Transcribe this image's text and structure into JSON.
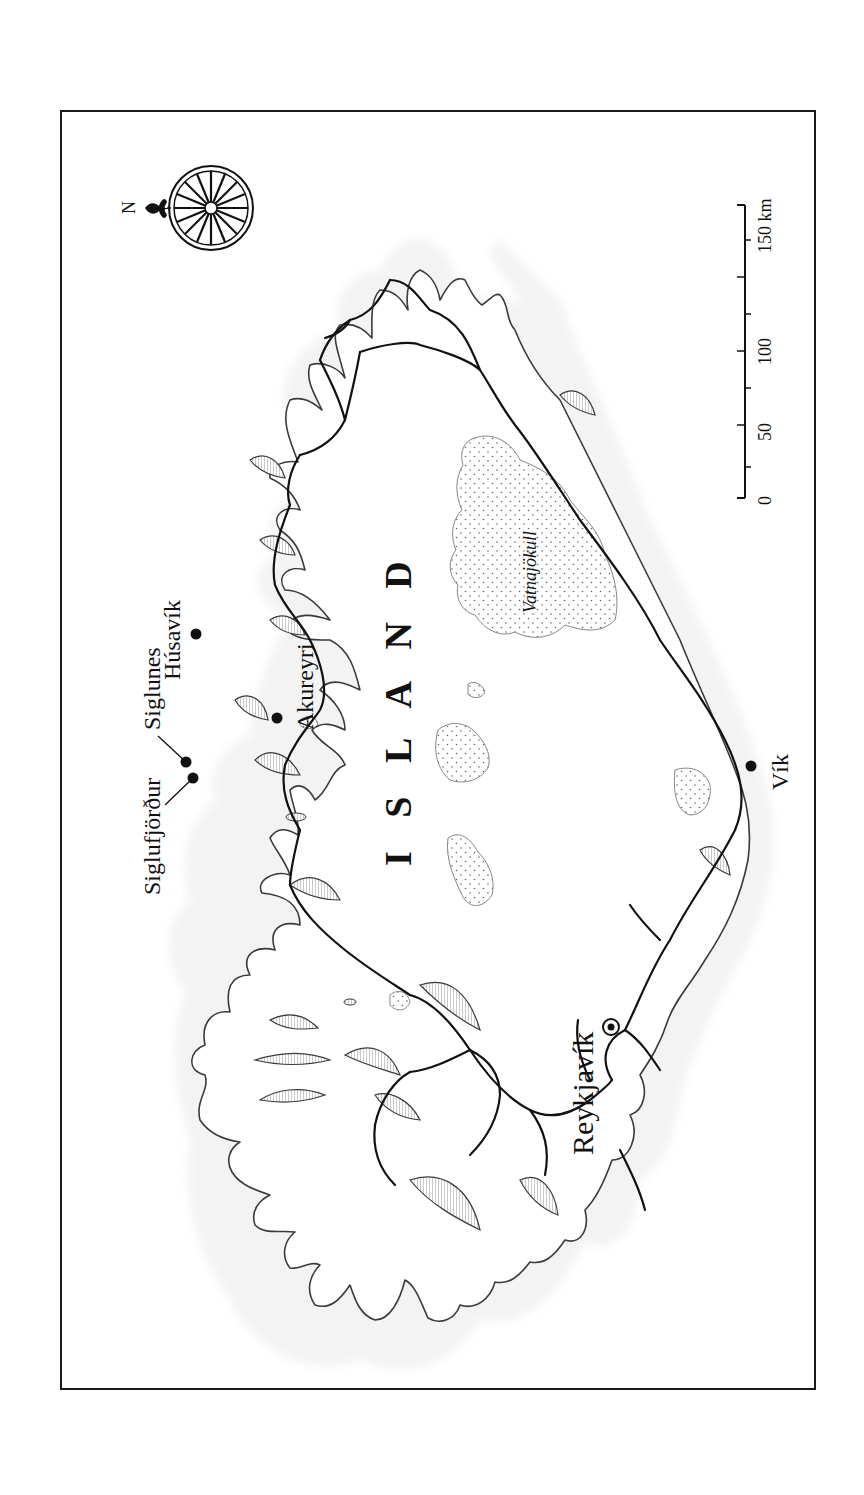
{
  "map": {
    "title": "I S L A N D",
    "country_label": "ISLAND",
    "orientation": "rotated 90° counter-clockwise (north points left)",
    "colors": {
      "ink": "#111111",
      "frame": "#1a1a1a",
      "sea_hatch": "#9a9a9a",
      "glacier_outline": "#777777",
      "background": "#ffffff"
    },
    "compass": {
      "label": "N",
      "icon": "compass-rose-icon"
    },
    "scale_bar": {
      "unit_label": "150 km",
      "ticks": [
        "0",
        "50",
        "100",
        "150 km"
      ]
    },
    "glaciers": [
      {
        "name": "Vatnajökull",
        "label": "Vatnajökull"
      }
    ],
    "places": [
      {
        "name": "Reykjavík",
        "type": "capital",
        "label": "Reykjavík"
      },
      {
        "name": "Siglufjörður",
        "type": "town",
        "label": "Siglufjörður"
      },
      {
        "name": "Siglunes",
        "type": "town",
        "label": "Siglunes"
      },
      {
        "name": "Húsavík",
        "type": "town",
        "label": "Húsavík"
      },
      {
        "name": "Akureyri",
        "type": "town",
        "label": "Akureyri"
      },
      {
        "name": "Vík",
        "type": "town",
        "label": "Vík"
      }
    ]
  }
}
